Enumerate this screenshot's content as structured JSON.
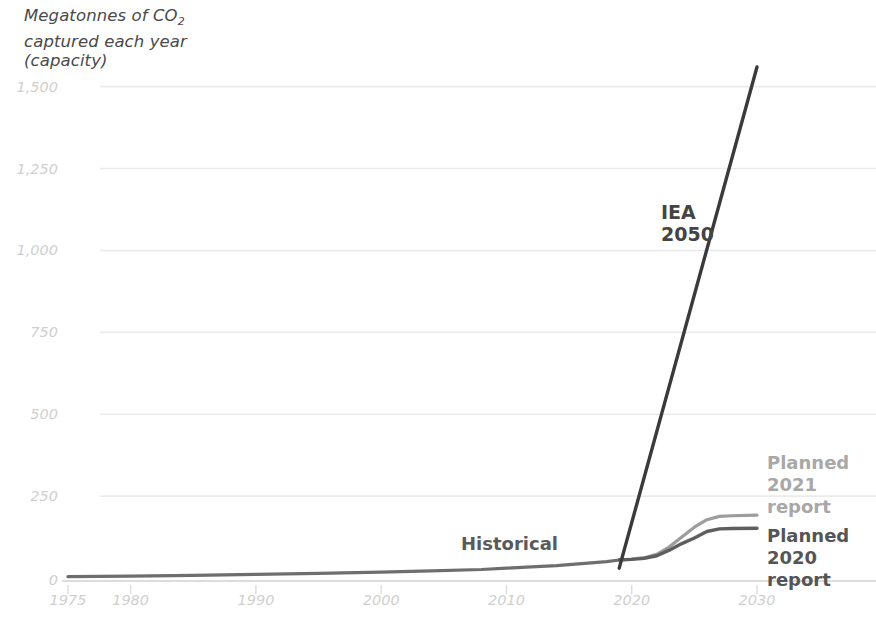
{
  "chart_data": {
    "type": "line",
    "title_line1": "Megatonnes of CO",
    "title_sub": "2",
    "title_line2": "captured each year",
    "title_line3": "(capacity)",
    "xlabel": "",
    "ylabel": "Megatonnes of CO2 captured each year (capacity)",
    "xlim": [
      1975,
      2030
    ],
    "ylim": [
      0,
      1560
    ],
    "grid": true,
    "legend_position": "right-inline",
    "x_ticks": [
      1975,
      1980,
      1990,
      2000,
      2010,
      2020,
      2030
    ],
    "x_tick_labels": [
      "1975",
      "1980",
      "1990",
      "2000",
      "2010",
      "2020",
      "2030"
    ],
    "y_ticks": [
      0,
      250,
      500,
      750,
      1000,
      1250,
      1500
    ],
    "y_tick_labels": [
      "0",
      "250",
      "500",
      "750",
      "1,000",
      "1,250",
      "1,500"
    ],
    "annotations": [
      {
        "name": "iea-2050",
        "text": "IEA\n2050",
        "x": 2022,
        "y": 1180,
        "color": "#444444"
      },
      {
        "name": "historical",
        "text": "Historical",
        "x": 2007,
        "y": 110,
        "color": "#5a5a5a"
      }
    ],
    "series": [
      {
        "name": "Historical",
        "color": "#6e6e6e",
        "x": [
          1975,
          1980,
          1985,
          1990,
          1995,
          2000,
          2004,
          2008,
          2010,
          2012,
          2014,
          2016,
          2018,
          2019
        ],
        "values": [
          4,
          6,
          8,
          11,
          14,
          18,
          22,
          26,
          30,
          34,
          38,
          44,
          50,
          55
        ]
      },
      {
        "name": "Planned 2021 report",
        "color": "#9c9c9c",
        "x": [
          2019,
          2020,
          2021,
          2022,
          2023,
          2024,
          2025,
          2026,
          2027,
          2028,
          2030
        ],
        "values": [
          55,
          58,
          62,
          72,
          95,
          125,
          155,
          178,
          188,
          190,
          192
        ]
      },
      {
        "name": "Planned 2020 report",
        "color": "#5e5e5e",
        "x": [
          2019,
          2020,
          2021,
          2022,
          2023,
          2024,
          2025,
          2026,
          2027,
          2028,
          2030
        ],
        "values": [
          55,
          57,
          60,
          68,
          85,
          105,
          122,
          142,
          150,
          151,
          152
        ]
      },
      {
        "name": "IEA 2050",
        "color": "#3a3a3a",
        "x": [
          2019,
          2030
        ],
        "values": [
          30,
          1560
        ]
      }
    ],
    "legend": [
      {
        "name": "planned-2021-report",
        "label": "Planned\n2021\nreport",
        "color": "#a8a8a8"
      },
      {
        "name": "planned-2020-report",
        "label": "Planned\n2020\nreport",
        "color": "#555555"
      }
    ],
    "colors": {
      "gridline": "#ebebeb",
      "axis": "#d8d8d8",
      "tick_text": "#cfcfcf",
      "title_text": "#4a4a4a",
      "background": "#ffffff"
    }
  }
}
